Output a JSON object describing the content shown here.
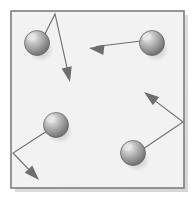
{
  "figure": {
    "width": 196,
    "height": 204,
    "background_color": "#ffffff"
  },
  "container": {
    "name": "container-box",
    "x": 11,
    "y": 11,
    "width": 173,
    "height": 177,
    "fill_color": "#f2f2f2",
    "border_color": "#7d7d7d",
    "border_width": 1.6,
    "shadow_color": "#b9b9b9"
  },
  "style": {
    "arrow_color": "#6e6e6e",
    "arrow_width": 1.1,
    "sphere_base_color": "#9a9a9a",
    "sphere_highlight_color": "#e6e6e6",
    "sphere_edge_color": "#5d5d5d",
    "sphere_shadow_color": "#c4c4c4"
  },
  "particles": [
    {
      "name": "particle-top-left",
      "cx": 37,
      "cy": 43,
      "r": 12.5
    },
    {
      "name": "particle-top-right",
      "cx": 152,
      "cy": 43,
      "r": 12.5
    },
    {
      "name": "particle-bottom-left",
      "cx": 56,
      "cy": 125,
      "r": 12.5
    },
    {
      "name": "particle-bottom-right",
      "cx": 133,
      "cy": 153,
      "r": 12.5
    }
  ],
  "trajectories": [
    {
      "name": "trajectory-top-left",
      "particle": "particle-top-left",
      "bounce_wall": "top",
      "points": "44,36 55,14 70,81",
      "arrow_tip": {
        "x": 70,
        "y": 82
      },
      "arrow_angle_deg": 77
    },
    {
      "name": "trajectory-top-right",
      "particle": "particle-top-right",
      "bounce_wall": "none",
      "points": "141,41 92,47",
      "arrow_tip": {
        "x": 89,
        "y": 48
      },
      "arrow_angle_deg": 187
    },
    {
      "name": "trajectory-bottom-left",
      "particle": "particle-bottom-left",
      "bounce_wall": "left",
      "points": "47,131 13,153 37,178",
      "arrow_tip": {
        "x": 39,
        "y": 180
      },
      "arrow_angle_deg": 46
    },
    {
      "name": "trajectory-bottom-right",
      "particle": "particle-bottom-right",
      "bounce_wall": "right",
      "points": "143,149 183,122 146,94",
      "arrow_tip": {
        "x": 144,
        "y": 92
      },
      "arrow_angle_deg": 217
    }
  ]
}
